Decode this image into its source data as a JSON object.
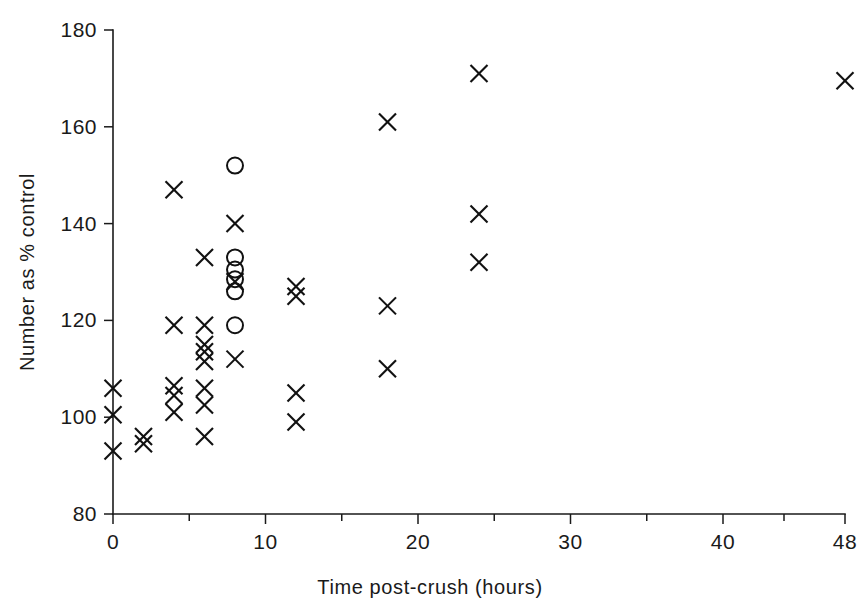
{
  "chart_data": {
    "type": "scatter",
    "title": "",
    "xlabel": "Time post-crush (hours)",
    "ylabel": "Number as % control",
    "xlim": [
      0,
      48
    ],
    "ylim": [
      80,
      180
    ],
    "grid": false,
    "legend": "none",
    "x_ticks": [
      {
        "value": 0,
        "label": "0",
        "major": true
      },
      {
        "value": 5,
        "label": "",
        "major": false
      },
      {
        "value": 10,
        "label": "10",
        "major": true
      },
      {
        "value": 15,
        "label": "",
        "major": false
      },
      {
        "value": 20,
        "label": "20",
        "major": true
      },
      {
        "value": 25,
        "label": "",
        "major": false
      },
      {
        "value": 30,
        "label": "30",
        "major": true
      },
      {
        "value": 35,
        "label": "",
        "major": false
      },
      {
        "value": 40,
        "label": "40",
        "major": true
      },
      {
        "value": 44,
        "label": "",
        "major": false
      },
      {
        "value": 48,
        "label": "48",
        "major": true
      }
    ],
    "y_ticks": [
      {
        "value": 80,
        "label": "80"
      },
      {
        "value": 100,
        "label": "100"
      },
      {
        "value": 120,
        "label": "120"
      },
      {
        "value": 140,
        "label": "140"
      },
      {
        "value": 160,
        "label": "160"
      },
      {
        "value": 180,
        "label": "180"
      }
    ],
    "series": [
      {
        "name": "cross-markers",
        "marker": "x",
        "color": "#111111",
        "points": [
          [
            0,
            106
          ],
          [
            0,
            100.5
          ],
          [
            0,
            93
          ],
          [
            2,
            96
          ],
          [
            2,
            94.5
          ],
          [
            4,
            147
          ],
          [
            4,
            119
          ],
          [
            4,
            106.5
          ],
          [
            4,
            104.5
          ],
          [
            4,
            101
          ],
          [
            6,
            133
          ],
          [
            6,
            119
          ],
          [
            6,
            115
          ],
          [
            6,
            113.5
          ],
          [
            6,
            111.5
          ],
          [
            6,
            106
          ],
          [
            6,
            102.5
          ],
          [
            6,
            96
          ],
          [
            8,
            140
          ],
          [
            8,
            128
          ],
          [
            8,
            112
          ],
          [
            12,
            127
          ],
          [
            12,
            125
          ],
          [
            12,
            105
          ],
          [
            12,
            99
          ],
          [
            18,
            161
          ],
          [
            18,
            123
          ],
          [
            18,
            110
          ],
          [
            24,
            171
          ],
          [
            24,
            142
          ],
          [
            24,
            132
          ],
          [
            48,
            169.5
          ]
        ]
      },
      {
        "name": "circle-markers",
        "marker": "o",
        "color": "#111111",
        "points": [
          [
            8,
            152
          ],
          [
            8,
            133
          ],
          [
            8,
            130.5
          ],
          [
            8,
            128.5
          ],
          [
            8,
            126
          ],
          [
            8,
            119
          ]
        ]
      }
    ]
  },
  "axes": {
    "x_title": "Time post-crush (hours)",
    "y_title": "Number as % control"
  }
}
